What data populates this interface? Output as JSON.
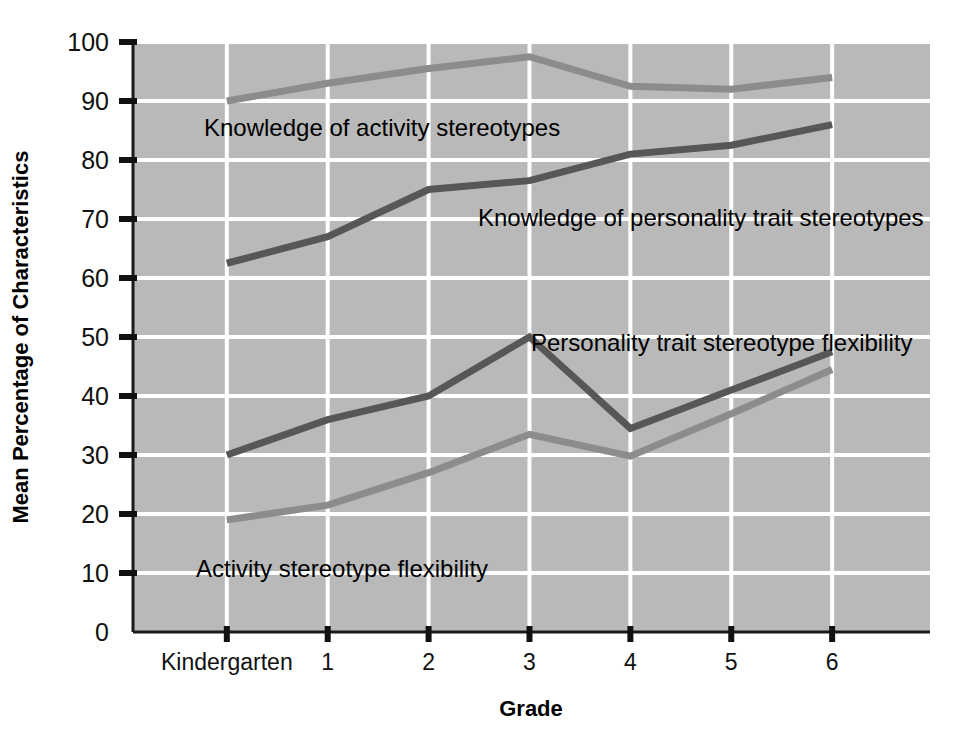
{
  "chart_data": {
    "type": "line",
    "title": "",
    "xlabel": "Grade",
    "ylabel": "Mean Percentage of Characteristics",
    "categories": [
      "Kindergarten",
      "1",
      "2",
      "3",
      "4",
      "5",
      "6"
    ],
    "xlim": [
      0,
      7.9
    ],
    "ylim": [
      0,
      100
    ],
    "ytick_labels": [
      "0",
      "10",
      "20",
      "30",
      "40",
      "50",
      "60",
      "70",
      "80",
      "90",
      "100"
    ],
    "ytick_values": [
      0,
      10,
      20,
      30,
      40,
      50,
      60,
      70,
      80,
      90,
      100
    ],
    "grid": true,
    "grid_color": "#ffffff",
    "plot_background": "#b9b9b9",
    "legend_position": "inline-annotations",
    "series": [
      {
        "name": "Knowledge of activity stereotypes",
        "color": "#8c8c8c",
        "values": [
          90,
          93,
          95.5,
          97.5,
          92.5,
          92,
          94
        ],
        "label_x": "Kindergarten",
        "label_text": "Knowledge of activity stereotypes"
      },
      {
        "name": "Knowledge of personality trait stereotypes",
        "color": "#575757",
        "values": [
          62.5,
          67,
          75,
          76.5,
          81,
          82.5,
          86
        ],
        "label_text": "Knowledge of personality trait stereotypes"
      },
      {
        "name": "Personality trait stereotype flexibility",
        "color": "#575757",
        "values": [
          30,
          36,
          40,
          50,
          34.5,
          41,
          47.5
        ],
        "label_text": "Personality trait stereotype flexibility"
      },
      {
        "name": "Activity stereotype flexibility",
        "color": "#8c8c8c",
        "values": [
          19,
          21.5,
          27,
          33.5,
          29.8,
          37,
          44.5
        ],
        "label_text": "Activity stereotype flexibility"
      }
    ],
    "annotations": [
      {
        "text": "Knowledge of activity stereotypes",
        "x": 204,
        "y": 136
      },
      {
        "text": "Knowledge of personality trait stereotypes",
        "x": 478,
        "y": 226
      },
      {
        "text": "Personality trait stereotype flexibility",
        "x": 531,
        "y": 351
      },
      {
        "text": "Activity stereotype flexibility",
        "x": 196,
        "y": 577
      }
    ]
  }
}
